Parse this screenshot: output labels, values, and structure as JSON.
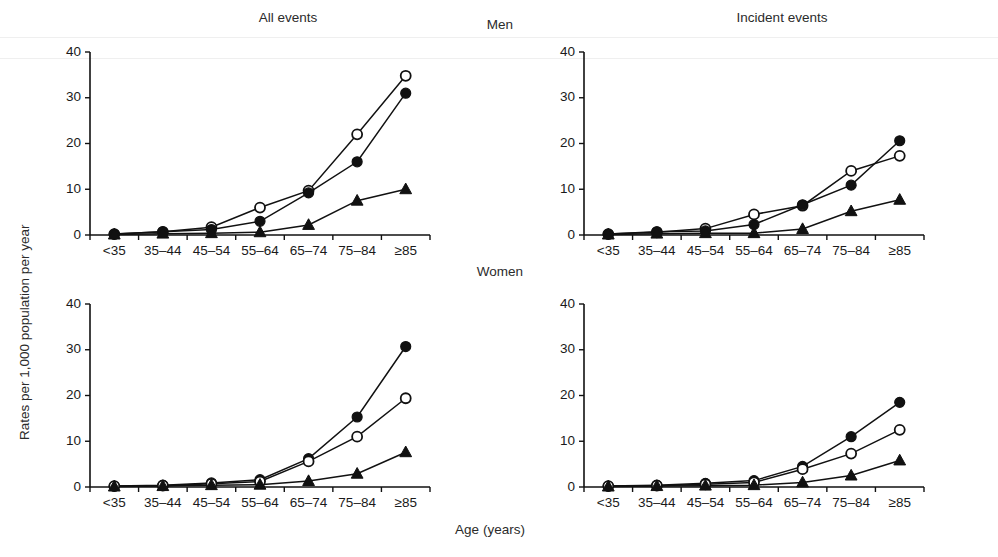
{
  "figure": {
    "ylabel": "Rates per 1,000 population per year",
    "xlabel": "Age (years)",
    "column_titles": [
      "All events",
      "Incident events"
    ],
    "row_titles": [
      "Men",
      "Women"
    ]
  },
  "chart_data": [
    {
      "type": "line",
      "title": "All events",
      "panel": "Men / All events",
      "row": "Men",
      "column": "All events",
      "xlabel": "Age (years)",
      "ylabel": "Rates per 1,000 population per year",
      "categories": [
        "<35",
        "35–44",
        "45–54",
        "55–64",
        "65–74",
        "75–84",
        "≥85"
      ],
      "ylim": [
        0,
        40
      ],
      "yticks": [
        0,
        10,
        20,
        30,
        40
      ],
      "grid": false,
      "legend": "none",
      "series": [
        {
          "name": "open-circle",
          "marker": "open-circle",
          "values": [
            0.2,
            0.7,
            1.7,
            6.0,
            9.7,
            22.0,
            34.8
          ]
        },
        {
          "name": "filled-circle",
          "marker": "filled-circle",
          "values": [
            0.2,
            0.7,
            1.2,
            3.0,
            9.2,
            16.0,
            31.0
          ]
        },
        {
          "name": "filled-triangle",
          "marker": "filled-triangle",
          "values": [
            0.1,
            0.3,
            0.4,
            0.6,
            2.2,
            7.5,
            10.0
          ]
        }
      ]
    },
    {
      "type": "line",
      "title": "Incident events",
      "panel": "Men / Incident events",
      "row": "Men",
      "column": "Incident events",
      "xlabel": "Age (years)",
      "ylabel": "Rates per 1,000 population per year",
      "categories": [
        "<35",
        "35–44",
        "45–54",
        "55–64",
        "65–74",
        "75–84",
        "≥85"
      ],
      "ylim": [
        0,
        40
      ],
      "yticks": [
        0,
        10,
        20,
        30,
        40
      ],
      "grid": false,
      "legend": "none",
      "series": [
        {
          "name": "open-circle",
          "marker": "open-circle",
          "values": [
            0.2,
            0.6,
            1.4,
            4.5,
            6.4,
            14.0,
            17.3
          ]
        },
        {
          "name": "filled-circle",
          "marker": "filled-circle",
          "values": [
            0.2,
            0.7,
            0.9,
            2.3,
            6.6,
            10.9,
            20.6
          ]
        },
        {
          "name": "filled-triangle",
          "marker": "filled-triangle",
          "values": [
            0.1,
            0.3,
            0.4,
            0.4,
            1.3,
            5.2,
            7.7
          ]
        }
      ]
    },
    {
      "type": "line",
      "title": "All events",
      "panel": "Women / All events",
      "row": "Women",
      "column": "All events",
      "xlabel": "Age (years)",
      "ylabel": "Rates per 1,000 population per year",
      "categories": [
        "<35",
        "35–44",
        "45–54",
        "55–64",
        "65–74",
        "75–84",
        "≥85"
      ],
      "ylim": [
        0,
        40
      ],
      "yticks": [
        0,
        10,
        20,
        30,
        40
      ],
      "grid": false,
      "legend": "none",
      "series": [
        {
          "name": "filled-circle",
          "marker": "filled-circle",
          "values": [
            0.2,
            0.4,
            0.9,
            1.6,
            6.2,
            15.3,
            30.7
          ]
        },
        {
          "name": "open-circle",
          "marker": "open-circle",
          "values": [
            0.2,
            0.3,
            0.7,
            1.2,
            5.6,
            11.0,
            19.4
          ]
        },
        {
          "name": "filled-triangle",
          "marker": "filled-triangle",
          "values": [
            0.1,
            0.2,
            0.4,
            0.5,
            1.3,
            2.9,
            7.6
          ]
        }
      ]
    },
    {
      "type": "line",
      "title": "Incident events",
      "panel": "Women / Incident events",
      "row": "Women",
      "column": "Incident events",
      "xlabel": "Age (years)",
      "ylabel": "Rates per 1,000 population per year",
      "categories": [
        "<35",
        "35–44",
        "45–54",
        "55–64",
        "65–74",
        "75–84",
        "≥85"
      ],
      "ylim": [
        0,
        40
      ],
      "yticks": [
        0,
        10,
        20,
        30,
        40
      ],
      "grid": false,
      "legend": "none",
      "series": [
        {
          "name": "filled-circle",
          "marker": "filled-circle",
          "values": [
            0.2,
            0.4,
            0.8,
            1.4,
            4.5,
            11.0,
            18.5
          ]
        },
        {
          "name": "open-circle",
          "marker": "open-circle",
          "values": [
            0.2,
            0.3,
            0.6,
            1.0,
            3.9,
            7.3,
            12.5
          ]
        },
        {
          "name": "filled-triangle",
          "marker": "filled-triangle",
          "values": [
            0.1,
            0.2,
            0.3,
            0.4,
            1.0,
            2.5,
            5.8
          ]
        }
      ]
    }
  ]
}
